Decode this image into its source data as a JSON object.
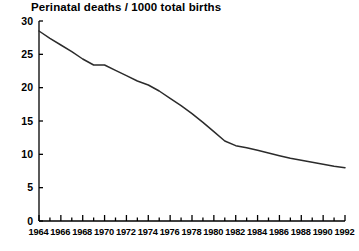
{
  "chart_data": {
    "type": "line",
    "title": "Perinatal deaths / 1000 total births",
    "xlabel": "",
    "ylabel": "",
    "xlim": [
      1964,
      1992
    ],
    "ylim": [
      0,
      30
    ],
    "grid": false,
    "legend": "none",
    "y_ticks": [
      0,
      5,
      10,
      15,
      20,
      25,
      30
    ],
    "y_tick_labels": [
      "0",
      "5",
      "10",
      "15",
      "20",
      "25",
      "30"
    ],
    "x_ticks": [
      1964,
      1965,
      1966,
      1967,
      1968,
      1969,
      1970,
      1971,
      1972,
      1973,
      1974,
      1975,
      1976,
      1977,
      1978,
      1979,
      1980,
      1981,
      1982,
      1983,
      1984,
      1985,
      1986,
      1987,
      1988,
      1989,
      1990,
      1991,
      1992
    ],
    "x_tick_labels": [
      "1964",
      "1966",
      "1968",
      "1970",
      "1972",
      "1974",
      "1976",
      "1978",
      "1980",
      "1982",
      "1984",
      "1986",
      "1988",
      "1990",
      "1992"
    ],
    "x_labeled_ticks": [
      1964,
      1966,
      1968,
      1970,
      1972,
      1974,
      1976,
      1978,
      1980,
      1982,
      1984,
      1986,
      1988,
      1990,
      1992
    ],
    "series": [
      {
        "name": "Perinatal deaths per 1000 total births",
        "color": "#2b2b2b",
        "x": [
          1964,
          1965,
          1966,
          1967,
          1968,
          1969,
          1970,
          1971,
          1972,
          1973,
          1974,
          1975,
          1976,
          1977,
          1978,
          1979,
          1980,
          1981,
          1982,
          1983,
          1984,
          1985,
          1986,
          1987,
          1988,
          1989,
          1990,
          1991,
          1992
        ],
        "values": [
          28.5,
          27.4,
          26.4,
          25.4,
          24.3,
          23.4,
          23.4,
          22.6,
          21.8,
          21.0,
          20.4,
          19.5,
          18.4,
          17.3,
          16.1,
          14.8,
          13.4,
          12.0,
          11.3,
          11.0,
          10.6,
          10.2,
          9.8,
          9.4,
          9.1,
          8.8,
          8.5,
          8.2,
          8.0
        ]
      }
    ]
  },
  "axes_geometry": {
    "left_px": 39,
    "right_px": 345,
    "top_px": 21,
    "bottom_px": 221
  }
}
